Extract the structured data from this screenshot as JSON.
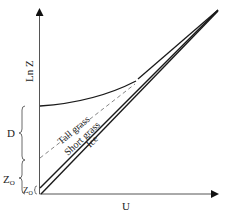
{
  "diagram": {
    "y_axis_label": "Ln Z",
    "x_axis_label": "U",
    "curves": [
      {
        "id": "tall-grass",
        "label": "Tall grass",
        "style": "dashed-with-solid-displaced-profile"
      },
      {
        "id": "short-grass",
        "label": "Short grass",
        "style": "solid"
      },
      {
        "id": "ice",
        "label": "Ice",
        "style": "solid"
      }
    ],
    "brackets": [
      {
        "id": "displacement",
        "label": "D"
      },
      {
        "id": "roughness-grass",
        "label": "Z",
        "subscript": "O"
      },
      {
        "id": "roughness-ice",
        "label": "Z",
        "subscript": "O"
      }
    ],
    "colors": {
      "line": "#1a1a1a",
      "axis": "#555555",
      "dashed": "#666666",
      "background": "#ffffff"
    }
  }
}
